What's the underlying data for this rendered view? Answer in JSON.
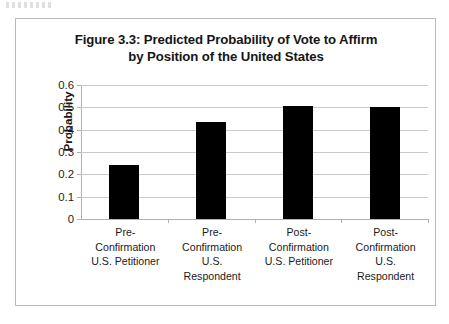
{
  "figure": {
    "title_line1": "Figure 3.3: Predicted Probability of Vote to Affirm",
    "title_line2": "by Position of the United States"
  },
  "chart_data": {
    "type": "bar",
    "title": "Figure 3.3: Predicted Probability of Vote to Affirm by Position of the United States",
    "xlabel": "",
    "ylabel": "Probability",
    "ylim": [
      0,
      0.6
    ],
    "yticks": [
      "0",
      "0.1",
      "0.2",
      "0.3",
      "0.4",
      "0.5",
      "0.6"
    ],
    "ytick_values": [
      0,
      0.1,
      0.2,
      0.3,
      0.4,
      0.5,
      0.6
    ],
    "grid": "horizontal",
    "legend": "none",
    "bar_color": "#000000",
    "categories": [
      "Pre-Confirmation U.S. Petitioner",
      "Pre-Confirmation U.S. Respondent",
      "Post-Confirmation U.S. Petitioner",
      "Post-Confirmation U.S. Respondent"
    ],
    "category_lines": [
      [
        "Pre-",
        "Confirmation",
        "U.S. Petitioner"
      ],
      [
        "Pre-",
        "Confirmation",
        "U.S.",
        "Respondent"
      ],
      [
        "Post-",
        "Confirmation",
        "U.S. Petitioner"
      ],
      [
        "Post-",
        "Confirmation",
        "U.S.",
        "Respondent"
      ]
    ],
    "values": [
      0.24,
      0.435,
      0.505,
      0.5
    ]
  }
}
